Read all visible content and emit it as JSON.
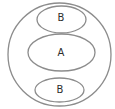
{
  "diagram": {
    "type": "nested-venn",
    "stroke_color": "#8c8c8c",
    "text_color": "#2e2e2e",
    "outer": {
      "label": "",
      "cx": 59.5,
      "cy": 54.5,
      "rx": 51.5,
      "ry": 51.5
    },
    "regions": [
      {
        "id": "top-b",
        "label": "B",
        "cx": 61.5,
        "cy": 19.5,
        "rx": 24.5,
        "ry": 13.5,
        "text_x": 61,
        "text_y": 17
      },
      {
        "id": "middle-a",
        "label": "A",
        "cx": 61.5,
        "cy": 52.5,
        "rx": 33.5,
        "ry": 18.5,
        "text_x": 61,
        "text_y": 52.5
      },
      {
        "id": "bottom-b",
        "label": "B",
        "cx": 59.5,
        "cy": 90,
        "rx": 24.5,
        "ry": 12,
        "text_x": 60,
        "text_y": 89
      }
    ]
  }
}
